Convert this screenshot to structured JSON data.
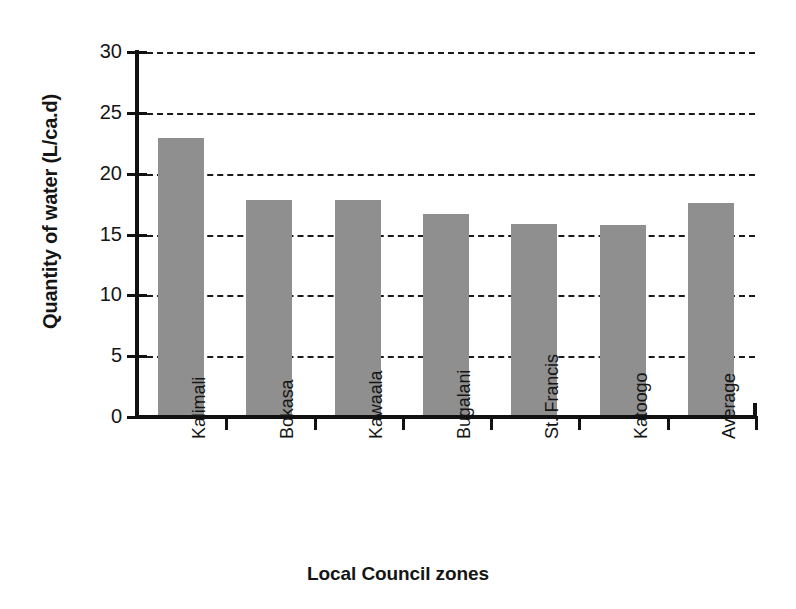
{
  "chart_data": {
    "type": "bar",
    "title": "",
    "subtitle": "",
    "xlabel": "Local Council  zones",
    "ylabel": "Quantity of water (L/ca.d)",
    "categories": [
      "Kalimali",
      "Bokasa",
      "Kawaala",
      "Bugalani",
      "St. Francis",
      "Katoogo",
      "Average"
    ],
    "values": [
      22.9,
      17.8,
      17.8,
      16.7,
      15.9,
      15.8,
      17.6
    ],
    "series": [
      {
        "name": "Quantity of water",
        "values": [
          22.9,
          17.8,
          17.8,
          16.7,
          15.9,
          15.8,
          17.6
        ]
      }
    ],
    "ylim": [
      0,
      30
    ],
    "ytick_labels": [
      "0",
      "5",
      "10",
      "15",
      "20",
      "25",
      "30"
    ],
    "ytick_values": [
      0,
      5,
      10,
      15,
      20,
      25,
      30
    ],
    "grid": "horizontal-dashed",
    "legend": "none",
    "bar_color": "#8f8f8f",
    "axis_color": "#111111",
    "background_color": "#ffffff",
    "text_color": "#151515"
  }
}
